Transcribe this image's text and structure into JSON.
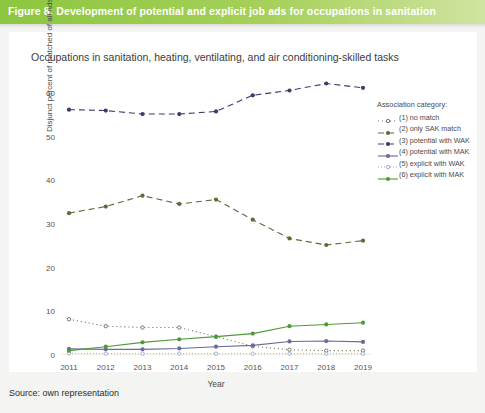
{
  "banner": {
    "title": "Figure 8: Development of potential and explicit job ads for occupations in sanitation"
  },
  "chart_title": "Occupations in sanitation, heating, ventilating, and air conditioning-skilled tasks",
  "source": "Source: own representation",
  "legend": {
    "title": "Association category:"
  },
  "chart_data": {
    "type": "line",
    "title": "Occupations in sanitation, heating, ventilating, and air conditioning-skilled tasks",
    "xlabel": "Year",
    "ylabel": "Disjunct percent of matched of all ads",
    "categories": [
      "2011",
      "2012",
      "2013",
      "2014",
      "2015",
      "2016",
      "2017",
      "2018",
      "2019"
    ],
    "x": [
      2011,
      2012,
      2013,
      2014,
      2015,
      2016,
      2017,
      2018,
      2019
    ],
    "xlim": [
      2011,
      2019
    ],
    "ylim": [
      0,
      63
    ],
    "yticks": [
      0,
      10,
      20,
      30,
      40,
      50,
      60
    ],
    "grid": false,
    "legend_position": "right",
    "series": [
      {
        "name": "(1) no match",
        "key": "no-match",
        "color": "#6b6b5a",
        "dash": "1,3",
        "marker": "circle-open",
        "values": [
          8.2,
          6.6,
          6.3,
          6.3,
          4.2,
          2.0,
          1.2,
          1.0,
          1.0
        ]
      },
      {
        "name": "(2) only SAK match",
        "key": "only-sak-match",
        "color": "#5a6e3a",
        "dash": "6,4",
        "marker": "circle",
        "values": [
          32.5,
          34.0,
          36.5,
          34.6,
          35.6,
          31.0,
          26.7,
          25.2,
          26.2
        ]
      },
      {
        "name": "(3) potential with WAK",
        "key": "potential-with-wak",
        "color": "#3b3b6e",
        "dash": "6,4",
        "marker": "circle",
        "values": [
          56.2,
          56.0,
          55.2,
          55.2,
          55.8,
          59.5,
          60.6,
          62.2,
          61.2
        ]
      },
      {
        "name": "(4) potential with MAK",
        "key": "potential-with-mak",
        "color": "#6a6a9c",
        "dash": "none",
        "marker": "circle",
        "values": [
          1.4,
          1.3,
          1.3,
          1.5,
          1.9,
          2.2,
          3.1,
          3.2,
          3.0
        ]
      },
      {
        "name": "(5) explicit with WAK",
        "key": "explicit-with-wak",
        "color": "#9aa7c4",
        "dash": "1,2",
        "marker": "circle-open",
        "values": [
          0.4,
          0.3,
          0.3,
          0.3,
          0.3,
          0.3,
          0.3,
          0.3,
          0.3
        ]
      },
      {
        "name": "(6) explicit with MAK",
        "key": "explicit-with-mak",
        "color": "#4f9a36",
        "dash": "none",
        "marker": "circle",
        "values": [
          1.0,
          1.9,
          2.9,
          3.6,
          4.2,
          4.9,
          6.6,
          7.0,
          7.4
        ]
      }
    ]
  }
}
